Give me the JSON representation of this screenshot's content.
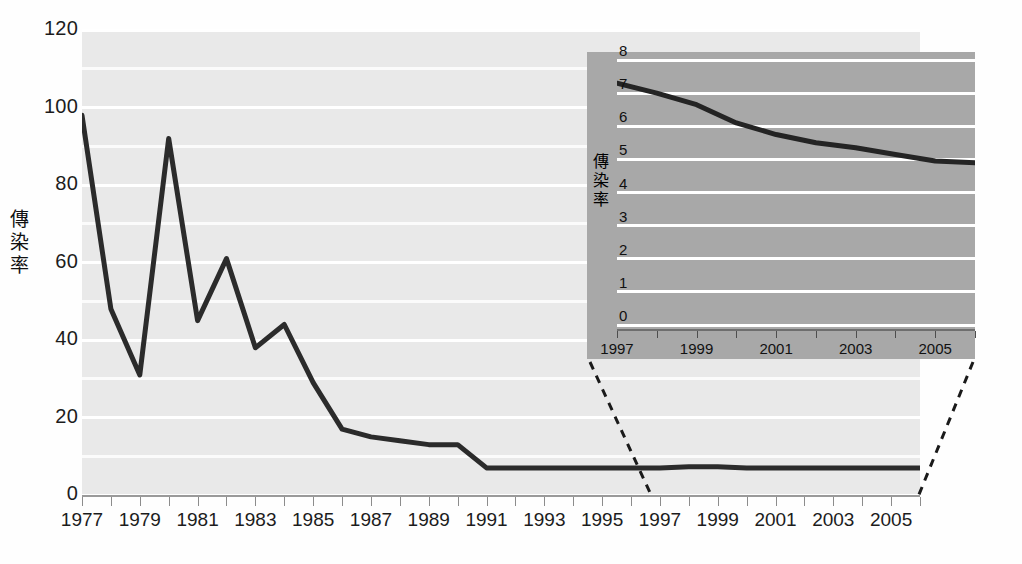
{
  "chart_data": [
    {
      "id": "main",
      "type": "line",
      "title": "",
      "xlabel": "",
      "ylabel": "傳染率",
      "xlim": [
        1977,
        2006
      ],
      "ylim": [
        0,
        120
      ],
      "ytick_labels": [
        "0",
        "20",
        "40",
        "60",
        "80",
        "100",
        "120"
      ],
      "ytick_values": [
        0,
        20,
        40,
        60,
        80,
        100,
        120
      ],
      "y_minor_step": 10,
      "grid": true,
      "grid_color": "#ffffff",
      "plot_bg": "#e9e9e9",
      "line_color": "#2b2b2b",
      "xtick_labels": [
        "1977",
        "1979",
        "1981",
        "1983",
        "1985",
        "1987",
        "1989",
        "1991",
        "1993",
        "1995",
        "1997",
        "1999",
        "2001",
        "2003",
        "2005"
      ],
      "x": [
        1977,
        1978,
        1979,
        1980,
        1981,
        1982,
        1983,
        1984,
        1985,
        1986,
        1987,
        1988,
        1989,
        1990,
        1991,
        1992,
        1993,
        1994,
        1995,
        1996,
        1997,
        1998,
        1999,
        2000,
        2001,
        2002,
        2003,
        2004,
        2005,
        2006
      ],
      "values": [
        98,
        48,
        31,
        92,
        45,
        61,
        38,
        44,
        29,
        17,
        15,
        14,
        13,
        13,
        7,
        7,
        7,
        7,
        7,
        7,
        7,
        7.3,
        7.3,
        7,
        7,
        7,
        7,
        7,
        7,
        7
      ]
    },
    {
      "id": "inset",
      "type": "line",
      "title": "",
      "xlabel": "",
      "ylabel": "傳染率",
      "xlim": [
        1997,
        2006
      ],
      "ylim": [
        0,
        8
      ],
      "ytick_labels": [
        "0",
        "1",
        "2",
        "3",
        "4",
        "5",
        "6",
        "7",
        "8"
      ],
      "ytick_values": [
        0,
        1,
        2,
        3,
        4,
        5,
        6,
        7,
        8
      ],
      "grid": true,
      "grid_color": "#ffffff",
      "plot_bg": "#a8a8a8",
      "line_color": "#242424",
      "xtick_labels": [
        "1997",
        "1999",
        "2001",
        "2003",
        "2005"
      ],
      "x": [
        1997,
        1998,
        1999,
        2000,
        2001,
        2002,
        2003,
        2004,
        2005,
        2006
      ],
      "values": [
        7.3,
        7.0,
        6.65,
        6.1,
        5.75,
        5.5,
        5.35,
        5.15,
        4.95,
        4.9
      ]
    }
  ],
  "main": {
    "axis_title": "傳染率",
    "y_labels": [
      "120",
      "100",
      "80",
      "60",
      "40",
      "20",
      "0"
    ],
    "x_labels": [
      "1977",
      "1979",
      "1981",
      "1983",
      "1985",
      "1987",
      "1989",
      "1991",
      "1993",
      "1995",
      "1997",
      "1999",
      "2001",
      "2003",
      "2005"
    ]
  },
  "inset": {
    "axis_title": "傳染率",
    "y_labels": [
      "8",
      "7",
      "6",
      "5",
      "4",
      "3",
      "2",
      "1",
      "0"
    ],
    "x_labels": [
      "1997",
      "1999",
      "2001",
      "2003",
      "2005"
    ]
  },
  "colors": {
    "main_plot_bg": "#e9e9e9",
    "inset_bg": "#a8a8a8",
    "grid": "#ffffff",
    "line": "#2b2b2b",
    "connector": "#1a1a1a"
  }
}
